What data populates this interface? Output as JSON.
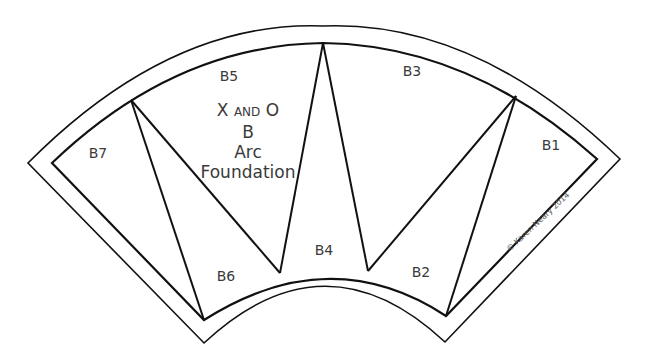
{
  "diagram": {
    "title_lines": [
      "X",
      "AND",
      "O",
      "B",
      "Arc",
      "Foundation"
    ],
    "title": {
      "line1_a": "X",
      "line1_small": "AND",
      "line1_b": "O",
      "line2": "B",
      "line3": "Arc",
      "line4": "Foundation"
    },
    "pieces": [
      {
        "id": "B1",
        "label": "B1",
        "x": 551,
        "y": 145
      },
      {
        "id": "B2",
        "label": "B2",
        "x": 421,
        "y": 272
      },
      {
        "id": "B3",
        "label": "B3",
        "x": 412,
        "y": 71
      },
      {
        "id": "B4",
        "label": "B4",
        "x": 324,
        "y": 250
      },
      {
        "id": "B5",
        "label": "B5",
        "x": 229,
        "y": 76
      },
      {
        "id": "B6",
        "label": "B6",
        "x": 226,
        "y": 276
      },
      {
        "id": "B7",
        "label": "B7",
        "x": 98,
        "y": 153
      }
    ],
    "copyright": "© Karen Neary 2014",
    "line_color": "#111111"
  }
}
